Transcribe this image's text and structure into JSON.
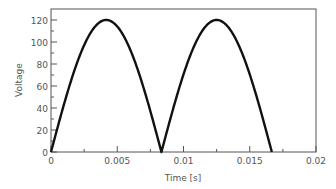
{
  "chart_data": {
    "type": "line",
    "title": "",
    "xlabel": "Time [s]",
    "ylabel": "Voltage",
    "xlim": [
      0,
      0.02
    ],
    "ylim": [
      0,
      130
    ],
    "x_ticks": [
      "0",
      "0.005",
      "0.01",
      "0.015",
      "0.02"
    ],
    "x_tick_values": [
      0,
      0.005,
      0.01,
      0.015,
      0.02
    ],
    "y_ticks": [
      "0",
      "20",
      "40",
      "60",
      "80",
      "100",
      "120"
    ],
    "y_tick_values": [
      0,
      20,
      40,
      60,
      80,
      100,
      120
    ],
    "grid": false,
    "legend": null,
    "series": [
      {
        "name": "Full-wave rectified voltage",
        "description": "|120 sin(2*pi*60*t)| for t in [0, 1/60]",
        "amplitude": 120,
        "frequency_hz": 60,
        "t_end": 0.016667,
        "x": [
          0,
          0.00104,
          0.00208,
          0.00313,
          0.00417,
          0.00521,
          0.00625,
          0.00729,
          0.00833,
          0.00938,
          0.01042,
          0.01146,
          0.0125,
          0.01354,
          0.01458,
          0.01563,
          0.01667
        ],
        "y": [
          0,
          45.9,
          84.9,
          110.9,
          120,
          110.9,
          84.9,
          45.9,
          0,
          45.9,
          84.9,
          110.9,
          120,
          110.9,
          84.9,
          45.9,
          0
        ]
      }
    ]
  }
}
